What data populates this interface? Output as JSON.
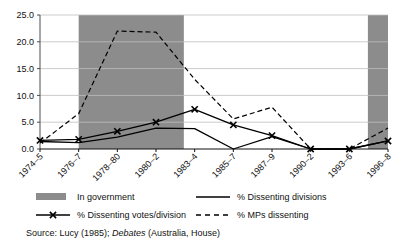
{
  "chart_data": {
    "type": "line",
    "title": "",
    "xlabel": "",
    "ylabel": "",
    "ylim": [
      0,
      25
    ],
    "yticks": [
      "0.0",
      "5.0",
      "10.0",
      "15.0",
      "20.0",
      "25.0"
    ],
    "ytick_values": [
      0,
      5,
      10,
      15,
      20,
      25
    ],
    "grid": true,
    "legend_position": "below-plot",
    "categories": [
      "1974–5",
      "1976–7",
      "1978–80",
      "1980–2",
      "1983–4",
      "1985–7",
      "1987–9",
      "1990–2",
      "1993–6",
      "1996–8"
    ],
    "series": [
      {
        "name": "% Dissenting divisions",
        "style": "solid",
        "marker": "none",
        "color": "#000000",
        "values": [
          1.4,
          1.2,
          2.2,
          3.9,
          3.8,
          0.0,
          2.3,
          0.0,
          0.0,
          1.5
        ]
      },
      {
        "name": "% Dissenting votes/division",
        "style": "solid",
        "marker": "x",
        "color": "#000000",
        "values": [
          1.6,
          1.8,
          3.3,
          5.0,
          7.4,
          4.5,
          2.5,
          0.0,
          0.0,
          1.5
        ]
      },
      {
        "name": "% MPs dissenting",
        "style": "dashed",
        "marker": "none",
        "color": "#000000",
        "values": [
          1.1,
          6.6,
          22.0,
          21.8,
          13.0,
          5.6,
          7.8,
          0.0,
          0.0,
          3.9
        ]
      }
    ],
    "shaded_bands": [
      {
        "label": "In government",
        "from": "1976–7",
        "to": "1983–4",
        "color": "#8c8c8c"
      },
      {
        "label": "In government",
        "from": "1996–8",
        "to": "1996–8",
        "color": "#8c8c8c"
      }
    ],
    "annotations": []
  },
  "legend": {
    "items": [
      {
        "label": "In government",
        "swatch": "filled-band"
      },
      {
        "label": "% Dissenting divisions",
        "swatch": "solid-line"
      },
      {
        "label": "% Dissenting votes/division",
        "swatch": "line-with-x-marker"
      },
      {
        "label": "% MPs dissenting",
        "swatch": "dashed-line"
      }
    ]
  },
  "source": {
    "prefix": "Source:",
    "text_before_italic": "Lucy (1985);",
    "italic": "Debates",
    "text_after_italic": "(Australia, House)"
  },
  "colors": {
    "band": "#8c8c8c",
    "line": "#000000",
    "grid": "#bfbfbf",
    "axis": "#4d4d4d",
    "background": "#ffffff"
  }
}
